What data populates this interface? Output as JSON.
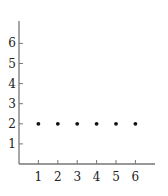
{
  "chart_data": {
    "type": "scatter",
    "title": "",
    "xlabel": "",
    "ylabel": "",
    "x": [
      1,
      2,
      3,
      4,
      5,
      6
    ],
    "series": [
      {
        "name": "points",
        "values": [
          2,
          2,
          2,
          2,
          2,
          2
        ]
      }
    ],
    "xticks": [
      1,
      2,
      3,
      4,
      5,
      6
    ],
    "yticks": [
      1,
      2,
      3,
      4,
      5,
      6
    ],
    "xlim": [
      0,
      7
    ],
    "ylim": [
      0,
      7
    ],
    "grid": false,
    "legend": null
  },
  "colors": {
    "axis": "#777777",
    "point": "#111111",
    "text": "#222222"
  }
}
